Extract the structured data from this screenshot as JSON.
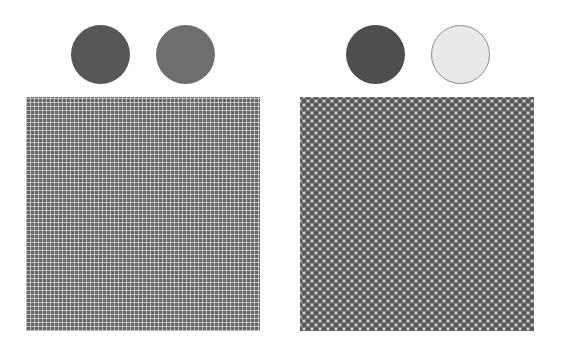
{
  "figure": {
    "panels": [
      {
        "id": "left",
        "swatches": [
          {
            "label": "dark-gray",
            "color": "#575757",
            "border": "#575757"
          },
          {
            "label": "mid-gray",
            "color": "#6e6e6e",
            "border": "#6e6e6e"
          }
        ],
        "pattern": {
          "type": "fine-grid",
          "base_color": "#6a6a6a",
          "line_color": "#d7d7d7",
          "pitch_px": 4
        }
      },
      {
        "id": "right",
        "swatches": [
          {
            "label": "dark-gray",
            "color": "#4e4e4e",
            "border": "#4e4e4e"
          },
          {
            "label": "light-gray",
            "color": "#e9e9e9",
            "border": "#8a8a8a"
          }
        ],
        "pattern": {
          "type": "dot-checker",
          "base_color": "#e6e6e6",
          "dot_color": "#5a5a5a",
          "pitch_px": 8
        }
      }
    ]
  }
}
